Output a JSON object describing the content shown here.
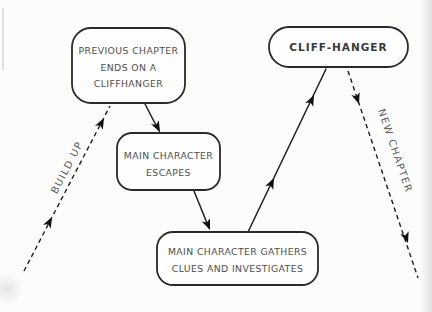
{
  "diagram": {
    "type": "flow-diagram",
    "theme": "story cliffhanger structure",
    "nodes": {
      "previous_chapter": {
        "lines": [
          "PREVIOUS CHAPTER",
          "ENDS ON A",
          "CLIFFHANGER"
        ],
        "shape": "rounded-rectangle"
      },
      "main_character_escapes": {
        "lines": [
          "MAIN CHARACTER",
          "ESCAPES"
        ],
        "shape": "rounded-rectangle"
      },
      "gathers_clues": {
        "lines": [
          "MAIN CHARACTER GATHERS",
          "CLUES AND INVESTIGATES"
        ],
        "shape": "rounded-rectangle"
      },
      "cliff_hanger": {
        "label": "CLIFF-HANGER",
        "shape": "pill"
      }
    },
    "edges": {
      "build_up": {
        "label": "BUILD UP",
        "style": "dashed",
        "direction": "up-right into previous-chapter node"
      },
      "new_chapter": {
        "label": "NEW CHAPTER",
        "style": "dashed",
        "direction": "down-right out of cliff-hanger node"
      },
      "drop_1": {
        "label": "",
        "style": "solid",
        "direction": "previous-chapter to escapes"
      },
      "drop_2": {
        "label": "",
        "style": "solid",
        "direction": "escapes to gathers-clues"
      },
      "rise_1": {
        "label": "",
        "style": "solid",
        "direction": "gathers-clues to cliff-hanger"
      }
    },
    "colors": {
      "ink": "#2a2a2a",
      "text": "#4f4f4f",
      "label_text": "#5a5a5a",
      "background": "#fcfcfa"
    }
  }
}
